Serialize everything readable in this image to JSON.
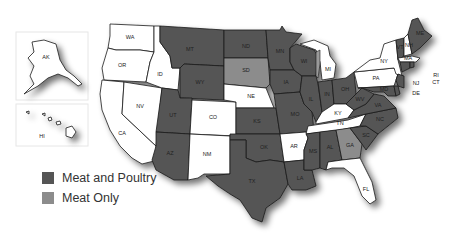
{
  "map": {
    "legend": [
      {
        "label": "Meat and Poultry",
        "color": "#555555"
      },
      {
        "label": "Meat Only",
        "color": "#8c8c8c"
      }
    ],
    "no_program_color": "#ffffff",
    "states": {
      "AK": "none",
      "HI": "none",
      "WA": "none",
      "OR": "none",
      "CA": "none",
      "NV": "none",
      "ID": "none",
      "MT": "meat_poultry",
      "WY": "meat_poultry",
      "UT": "meat_poultry",
      "AZ": "meat_poultry",
      "CO": "none",
      "NM": "none",
      "ND": "meat_poultry",
      "SD": "meat_only",
      "NE": "none",
      "KS": "meat_poultry",
      "OK": "meat_poultry",
      "TX": "meat_poultry",
      "MN": "meat_poultry",
      "IA": "meat_poultry",
      "MO": "meat_poultry",
      "AR": "none",
      "LA": "meat_poultry",
      "WI": "meat_poultry",
      "IL": "meat_poultry",
      "MI": "none",
      "IN": "meat_poultry",
      "OH": "meat_poultry",
      "KY": "none",
      "TN": "none",
      "MS": "meat_poultry",
      "AL": "meat_poultry",
      "GA": "meat_only",
      "FL": "none",
      "SC": "meat_poultry",
      "NC": "meat_poultry",
      "VA": "meat_poultry",
      "WV": "meat_poultry",
      "PA": "none",
      "NY": "none",
      "VT": "meat_poultry",
      "NH": "none",
      "ME": "meat_poultry",
      "MA": "none",
      "RI": "meat_poultry",
      "CT": "meat_poultry",
      "NJ": "meat_poultry",
      "DE": "meat_poultry",
      "MD": "meat_poultry"
    },
    "labels": {
      "AK": "AK",
      "HI": "HI",
      "WA": "WA",
      "OR": "OR",
      "CA": "CA",
      "NV": "NV",
      "ID": "ID",
      "MT": "MT",
      "WY": "WY",
      "UT": "UT",
      "AZ": "AZ",
      "CO": "CO",
      "NM": "NM",
      "ND": "ND",
      "SD": "SD",
      "NE": "NE",
      "KS": "KS",
      "OK": "OK",
      "TX": "TX",
      "MN": "MN",
      "IA": "IA",
      "MO": "MO",
      "AR": "AR",
      "LA": "LA",
      "WI": "WI",
      "IL": "IL",
      "MI": "MI",
      "IN": "IN",
      "OH": "OH",
      "KY": "KY",
      "TN": "TN",
      "MS": "MS",
      "AL": "AL",
      "GA": "GA",
      "FL": "FL",
      "SC": "SC",
      "NC": "NC",
      "VA": "VA",
      "WV": "WV",
      "PA": "PA",
      "NY": "NY",
      "VT": "VT",
      "NH": "NH",
      "ME": "ME",
      "MA": "MA",
      "RI": "RI",
      "CT": "CT",
      "NJ": "NJ",
      "DE": "DE",
      "MD": "MD"
    }
  }
}
